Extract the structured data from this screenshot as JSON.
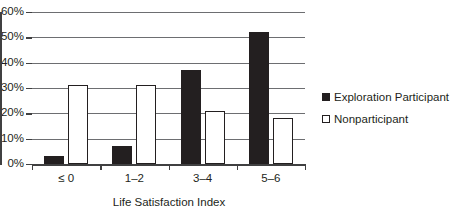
{
  "chart_data": {
    "type": "bar",
    "title": "",
    "subtitle": "",
    "xlabel": "Life Satisfaction Index",
    "ylabel": "",
    "categories": [
      "≤ 0",
      "1–2",
      "3–4",
      "5–6"
    ],
    "series": [
      {
        "name": "Exploration Participant",
        "values": [
          3,
          7,
          37,
          52
        ],
        "marker": "filled-square",
        "color": "#231f20"
      },
      {
        "name": "Nonparticipant",
        "values": [
          31,
          31,
          21,
          18
        ],
        "marker": "hollow-square",
        "color": "#ffffff"
      }
    ],
    "ylim": [
      0,
      60
    ],
    "ytick_values": [
      0,
      10,
      20,
      30,
      40,
      50,
      60
    ],
    "ytick_labels": [
      "0%",
      "10%",
      "20%",
      "30%",
      "40%",
      "50%",
      "60%"
    ],
    "grid": true,
    "grid_axis": "y",
    "legend_position": "right",
    "axis_color": "#404041",
    "grid_color": "#6d6e71",
    "text_color": "#231f20",
    "background": "#ffffff"
  },
  "legend": {
    "items": [
      {
        "label": "Exploration Participant",
        "swatch": "filled-square-icon"
      },
      {
        "label": "Nonparticipant",
        "swatch": "hollow-square-icon"
      }
    ]
  }
}
